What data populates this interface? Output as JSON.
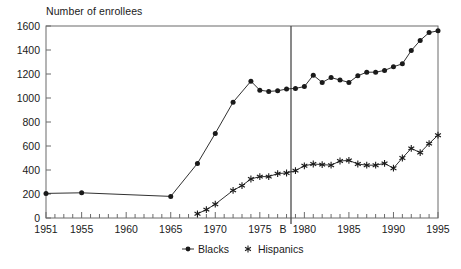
{
  "chart_data": {
    "type": "line",
    "title": "Number of enrollees",
    "xlabel": "",
    "ylabel": "Number of enrollees",
    "xlim": [
      1951,
      1995
    ],
    "ylim": [
      0,
      1600
    ],
    "yticks": [
      0,
      200,
      400,
      600,
      800,
      1000,
      1200,
      1400,
      1600
    ],
    "ytick_labels": [
      "0",
      "200",
      "400",
      "600",
      "800",
      "1000",
      "1200",
      "1400",
      "1600"
    ],
    "xticks": [
      1951,
      1955,
      1960,
      1965,
      1970,
      1975,
      1980,
      1985,
      1990,
      1995
    ],
    "xtick_labels": [
      "1951",
      "1955",
      "1960",
      "1965",
      "1970",
      "1975",
      "1980",
      "1985",
      "1990",
      "1995"
    ],
    "minor_xtick_interval": 1,
    "grid": false,
    "legend_position": "below-center",
    "annotations": [
      {
        "name": "vertical-reference-line",
        "label": "B",
        "x": 1978.5
      }
    ],
    "series": [
      {
        "name": "Blacks",
        "marker": "filled-circle",
        "color": "#1a1a1a",
        "points": [
          [
            1951,
            205
          ],
          [
            1955,
            210
          ],
          [
            1965,
            180
          ],
          [
            1968,
            455
          ],
          [
            1970,
            705
          ],
          [
            1972,
            965
          ],
          [
            1974,
            1140
          ],
          [
            1975,
            1065
          ],
          [
            1976,
            1055
          ],
          [
            1977,
            1060
          ],
          [
            1978,
            1075
          ],
          [
            1979,
            1080
          ],
          [
            1980,
            1095
          ],
          [
            1981,
            1190
          ],
          [
            1982,
            1130
          ],
          [
            1983,
            1170
          ],
          [
            1984,
            1150
          ],
          [
            1985,
            1130
          ],
          [
            1986,
            1185
          ],
          [
            1987,
            1215
          ],
          [
            1988,
            1215
          ],
          [
            1989,
            1230
          ],
          [
            1990,
            1260
          ],
          [
            1991,
            1285
          ],
          [
            1992,
            1395
          ],
          [
            1993,
            1480
          ],
          [
            1994,
            1545
          ],
          [
            1995,
            1560
          ]
        ]
      },
      {
        "name": "Hispanics",
        "marker": "star",
        "color": "#1a1a1a",
        "points": [
          [
            1968,
            35
          ],
          [
            1969,
            70
          ],
          [
            1970,
            115
          ],
          [
            1972,
            230
          ],
          [
            1973,
            270
          ],
          [
            1974,
            325
          ],
          [
            1975,
            345
          ],
          [
            1976,
            345
          ],
          [
            1977,
            370
          ],
          [
            1978,
            375
          ],
          [
            1979,
            395
          ],
          [
            1980,
            435
          ],
          [
            1981,
            450
          ],
          [
            1982,
            445
          ],
          [
            1983,
            440
          ],
          [
            1984,
            475
          ],
          [
            1985,
            480
          ],
          [
            1986,
            450
          ],
          [
            1987,
            440
          ],
          [
            1988,
            440
          ],
          [
            1989,
            455
          ],
          [
            1990,
            415
          ],
          [
            1991,
            500
          ],
          [
            1992,
            580
          ],
          [
            1993,
            545
          ],
          [
            1994,
            620
          ],
          [
            1995,
            690
          ]
        ]
      }
    ]
  },
  "legend": {
    "entries": [
      {
        "label": "Blacks",
        "marker": "filled-circle"
      },
      {
        "label": "Hispanics",
        "marker": "star"
      }
    ]
  }
}
